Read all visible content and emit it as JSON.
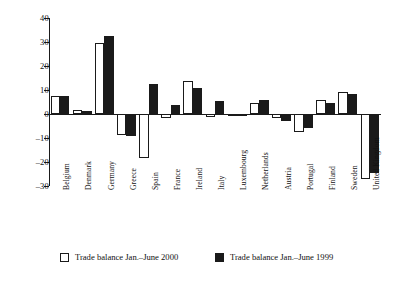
{
  "chart_data": {
    "type": "bar",
    "title": "",
    "subtitle": "",
    "xlabel": "",
    "ylabel": "",
    "ylim": [
      -30,
      40
    ],
    "yticks": [
      40,
      30,
      20,
      10,
      0,
      -10,
      -20,
      -30
    ],
    "ytick_labels": [
      "40",
      "30",
      "20",
      "10",
      "0",
      "–10",
      "–20",
      "–30"
    ],
    "grid": false,
    "legend_position": "bottom",
    "categories": [
      "Belgium",
      "Denmark",
      "Germany",
      "Greece",
      "Spain",
      "France",
      "Ireland",
      "Italy",
      "Luxembourg",
      "Netherlands",
      "Austria",
      "Portugal",
      "Finland",
      "Sweden",
      "United Kingdom"
    ],
    "series": [
      {
        "name": "Trade balance Jan.–June 2000",
        "style": "light",
        "color": "#ffffff",
        "edge_color": "#1a1a1a",
        "values": [
          7.7,
          1.6,
          29.5,
          -8.8,
          -18.5,
          -1.7,
          13.6,
          -1.3,
          -0.4,
          4.7,
          -1.6,
          -7.6,
          6.0,
          9.2,
          -27.2
        ]
      },
      {
        "name": "Trade balance Jan.–June 1999",
        "style": "dark",
        "color": "#1a1a1a",
        "edge_color": "#1a1a1a",
        "values": [
          7.4,
          1.2,
          32.4,
          -9.2,
          12.3,
          3.7,
          10.7,
          5.3,
          -0.5,
          5.8,
          -3.0,
          -6.0,
          4.4,
          8.3,
          -24.5
        ]
      }
    ]
  },
  "legend": {
    "items": [
      {
        "label": "Trade balance Jan.–June 2000",
        "style": "light"
      },
      {
        "label": "Trade balance Jan.–June 1999",
        "style": "dark"
      }
    ]
  }
}
